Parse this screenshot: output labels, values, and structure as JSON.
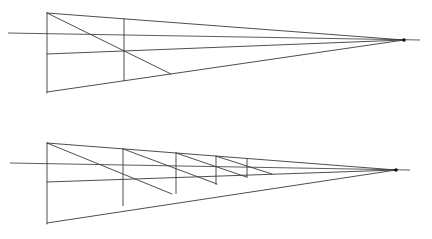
{
  "colors": {
    "line": "#3a3a3a",
    "vanishing_point": "#111111",
    "background": "#ffffff"
  },
  "figures": [
    {
      "name": "single-division",
      "horizon": {
        "x1": 8,
        "y1": 33,
        "x2": 420,
        "y2": 40
      },
      "vanishing_point": {
        "x": 404,
        "y": 40
      },
      "front_edge": {
        "x": 47,
        "top": 13,
        "middle": 54,
        "bottom": 92
      },
      "verticals": [
        {
          "x": 124,
          "top": 18.8,
          "bottom": 80.8
        }
      ],
      "diagonals": [
        {
          "x1": 47,
          "y1": 13,
          "x2": 171,
          "y2": 74
        }
      ]
    },
    {
      "name": "repeated-divisions",
      "horizon": {
        "x1": 10,
        "y1": 163,
        "x2": 410,
        "y2": 170
      },
      "vanishing_point": {
        "x": 396,
        "y": 170
      },
      "front_edge": {
        "x": 47,
        "top": 143,
        "middle": 182,
        "bottom": 223
      },
      "verticals": [
        {
          "x": 123,
          "top": 148.9,
          "bottom": 205.6
        },
        {
          "x": 176,
          "top": 153.0,
          "bottom": 193.4
        },
        {
          "x": 216,
          "top": 156.1,
          "bottom": 184.3
        },
        {
          "x": 247,
          "top": 158.5,
          "bottom": 177.2
        }
      ],
      "diagonals": [
        {
          "x1": 47,
          "y1": 143,
          "x2": 172,
          "y2": 194
        },
        {
          "x1": 123,
          "y1": 148.9,
          "x2": 217,
          "y2": 184
        },
        {
          "x1": 176,
          "y1": 153.0,
          "x2": 247,
          "y2": 177.2
        },
        {
          "x1": 216,
          "y1": 156.1,
          "x2": 272,
          "y2": 174
        }
      ]
    }
  ]
}
